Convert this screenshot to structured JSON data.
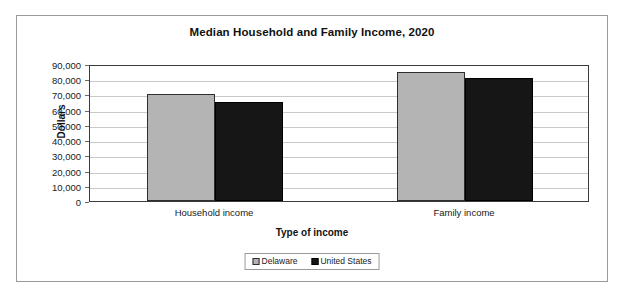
{
  "chart_data": {
    "type": "bar",
    "title": "Median Household and Family Income, 2020",
    "xlabel": "Type of income",
    "ylabel": "Dollars",
    "categories": [
      "Household income",
      "Family income"
    ],
    "series": [
      {
        "name": "Delaware",
        "color": "#b4b4b4",
        "values": [
          70000,
          85000
        ]
      },
      {
        "name": "United States",
        "color": "#161616",
        "values": [
          65000,
          81000
        ]
      }
    ],
    "ylim": [
      0,
      90000
    ],
    "ytick_values": [
      0,
      10000,
      20000,
      30000,
      40000,
      50000,
      60000,
      70000,
      80000,
      90000
    ],
    "ytick_labels": [
      "0",
      "10,000",
      "20,000",
      "30,000",
      "40,000",
      "50,000",
      "60,000",
      "70,000",
      "80,000",
      "90,000"
    ],
    "grid": true,
    "grid_axis": "y",
    "legend_position": "bottom",
    "legend_entries": [
      "Delaware",
      "United States"
    ]
  }
}
